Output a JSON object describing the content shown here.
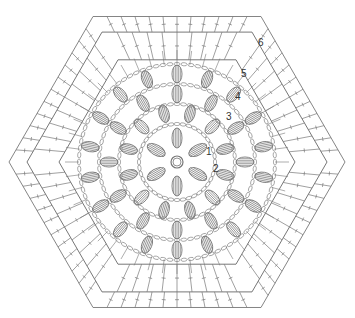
{
  "diagram": {
    "type": "crochet-chart",
    "shape": "hexagon",
    "center": [
      177,
      162
    ],
    "rounds": [
      {
        "number": "1",
        "label_pos": [
          206,
          155
        ],
        "radius": 38,
        "clusters": 6,
        "cluster_radius": 24
      },
      {
        "number": "2",
        "label_pos": [
          213,
          172
        ],
        "radius": 58,
        "clusters": 12,
        "cluster_radius": 50
      },
      {
        "number": "3",
        "label_pos": [
          226,
          120
        ],
        "radius": 78,
        "clusters": 12,
        "cluster_radius": 68
      },
      {
        "number": "4",
        "label_pos": [
          235,
          100
        ],
        "radius": 98,
        "clusters": 18,
        "cluster_radius": 88
      },
      {
        "number": "5",
        "label_pos": [
          241,
          77
        ],
        "radius": 115,
        "clusters": 24,
        "cluster_radius": 0
      },
      {
        "number": "6",
        "label_pos": [
          258,
          46
        ],
        "radius": 140,
        "clusters": 0,
        "cluster_radius": 0
      }
    ],
    "stroke_color": "#777777",
    "label_color": "#333333"
  }
}
